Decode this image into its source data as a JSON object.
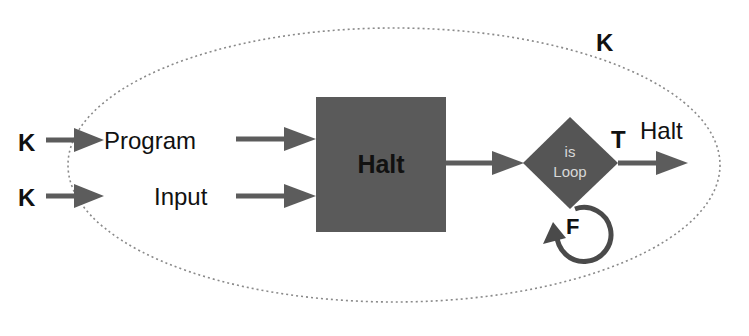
{
  "diagram": {
    "outer_label": "K",
    "inputs": [
      {
        "source": "K",
        "label": "Program"
      },
      {
        "source": "K",
        "label": "Input"
      }
    ],
    "halt_box": {
      "label": "Halt",
      "fill": "#5a5a5a",
      "text_color": "#111111"
    },
    "decision": {
      "line1": "is",
      "line2": "Loop",
      "fill": "#555555",
      "text_color": "#d8d8d8"
    },
    "true_branch": {
      "label": "T",
      "target": "Halt"
    },
    "false_branch": {
      "label": "F"
    },
    "colors": {
      "arrow": "#5c5c5c",
      "ellipse": "#8a8a8a",
      "text": "#111111"
    }
  }
}
